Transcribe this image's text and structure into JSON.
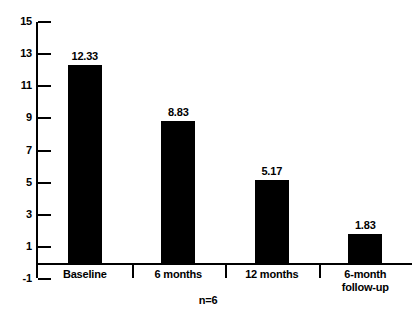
{
  "chart_data": {
    "type": "bar",
    "title": "",
    "subtitle": "",
    "xlabel": "",
    "ylabel": "",
    "categories": [
      "Baseline",
      "6 months",
      "12 months",
      "6-month follow-up"
    ],
    "category_lines": [
      [
        "Baseline"
      ],
      [
        "6 months"
      ],
      [
        "12 months"
      ],
      [
        "6-month",
        "follow-up"
      ]
    ],
    "values": [
      12.33,
      8.83,
      5.17,
      1.83
    ],
    "value_labels": [
      "12.33",
      "8.83",
      "5.17",
      "1.83"
    ],
    "ylim": [
      -1,
      15
    ],
    "ytick_values": [
      15,
      13,
      11,
      9,
      7,
      5,
      3,
      1,
      -1
    ],
    "ytick_labels": [
      "15",
      "13",
      "11",
      "9",
      "7",
      "5",
      "3",
      "1",
      "-1"
    ],
    "grid": false,
    "legend": null,
    "bar_color": "#000000",
    "axis_color": "#000000",
    "background_color": "#ffffff",
    "annotations": [
      "n=6"
    ]
  },
  "caption": "n=6"
}
